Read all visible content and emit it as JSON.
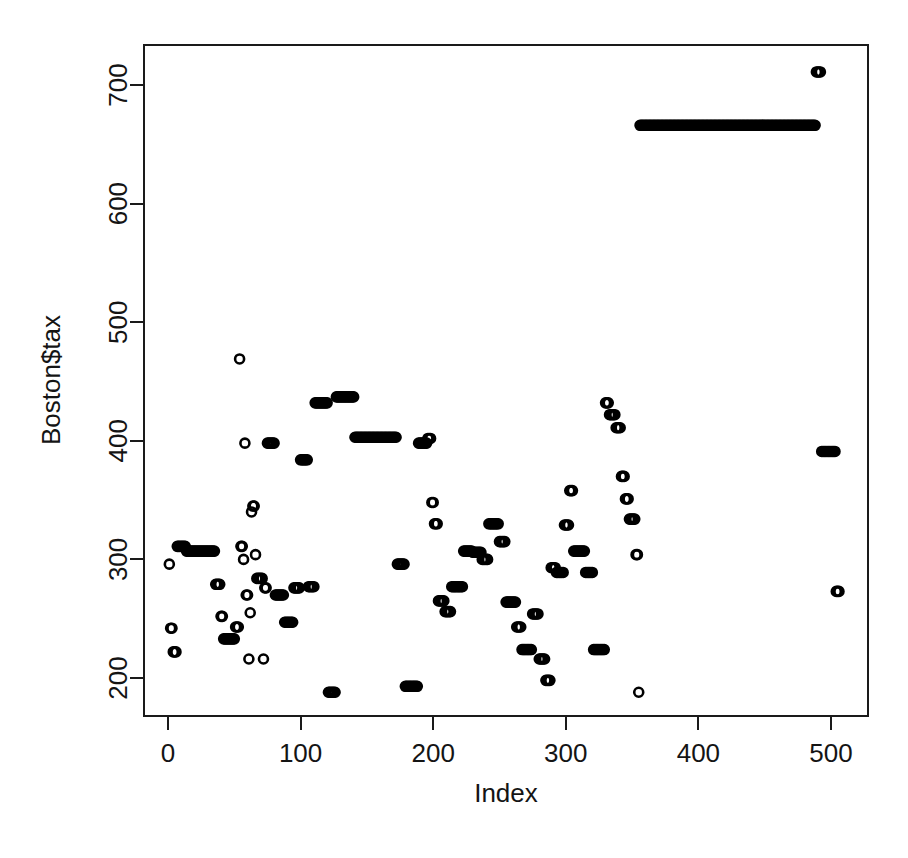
{
  "figure": {
    "background_color": "#ffffff",
    "foreground_color": "#000000",
    "width": 908,
    "height": 858
  },
  "axes": {
    "x_title": "Index",
    "y_title": "Boston$tax",
    "x_ticks": [
      "0",
      "100",
      "200",
      "300",
      "400",
      "500"
    ],
    "y_ticks": [
      "200",
      "300",
      "400",
      "500",
      "600",
      "700"
    ],
    "box": true,
    "grid": false
  },
  "chart_data": {
    "type": "scatter",
    "title": "",
    "xlabel": "Index",
    "ylabel": "Boston$tax",
    "xlim": [
      -9.1,
      515.1
    ],
    "ylim": [
      175.5,
      731.5
    ],
    "xticks": [
      0,
      100,
      200,
      300,
      400,
      500
    ],
    "yticks": [
      200,
      300,
      400,
      500,
      600,
      700
    ],
    "grid": false,
    "legend": null,
    "marker": {
      "shape": "open-circle",
      "color": "#000000",
      "size_px": 9,
      "stroke_width": 2.6
    },
    "n_points": 506,
    "series": [
      {
        "name": "Boston$tax",
        "x_start": 1,
        "x_step": 1,
        "values": [
          296,
          242,
          242,
          222,
          222,
          222,
          311,
          311,
          311,
          311,
          311,
          311,
          311,
          307,
          307,
          307,
          307,
          307,
          307,
          307,
          307,
          307,
          307,
          307,
          307,
          307,
          307,
          307,
          307,
          307,
          307,
          307,
          307,
          307,
          307,
          279,
          279,
          279,
          279,
          252,
          252,
          233,
          233,
          233,
          233,
          233,
          233,
          233,
          233,
          233,
          243,
          243,
          243,
          469,
          469,
          469,
          311,
          311,
          311,
          311,
          311,
          311,
          311,
          311,
          311,
          226,
          226,
          226,
          226,
          241,
          241,
          241,
          241,
          311,
          311,
          311,
          311,
          311,
          398,
          398,
          398,
          398,
          398,
          398,
          398,
          398,
          398,
          398,
          398,
          398,
          398,
          398,
          398,
          398,
          398,
          398,
          398,
          398,
          398,
          398,
          398,
          398,
          398,
          398,
          398,
          398,
          398,
          398,
          398,
          398,
          398,
          398,
          398,
          398,
          398,
          398,
          398,
          398,
          398,
          398,
          398,
          398,
          398,
          398,
          398,
          398,
          398,
          398,
          398,
          398,
          398,
          398,
          398,
          398,
          398,
          398,
          398,
          398,
          398,
          398,
          398,
          398,
          398,
          398,
          398,
          398,
          398,
          398,
          398,
          398,
          398,
          398,
          398,
          398,
          398,
          398,
          398,
          398,
          398,
          398,
          398,
          398,
          398,
          398,
          398,
          398,
          398,
          398,
          398,
          398,
          398,
          398,
          398,
          398,
          398,
          398,
          398,
          398,
          398,
          398,
          398,
          398,
          398,
          398,
          398,
          398,
          398,
          398,
          398,
          398,
          398,
          398,
          398,
          398,
          398,
          398,
          398,
          398,
          398,
          398,
          398,
          398,
          398,
          398,
          398,
          398,
          398,
          398,
          398,
          398,
          398,
          398,
          398,
          398,
          398,
          398,
          398,
          398,
          398,
          398,
          398,
          398,
          398,
          398,
          398,
          398,
          398,
          398,
          398,
          398,
          398,
          398,
          398,
          398,
          398,
          398,
          398,
          398,
          398,
          398,
          398,
          398,
          398,
          398,
          398,
          398,
          398,
          398,
          398,
          398,
          398,
          398,
          398,
          398,
          398,
          398,
          398,
          398,
          398,
          398,
          398,
          398,
          398,
          398,
          398,
          398,
          398,
          398,
          398,
          398,
          398,
          398,
          398,
          398,
          398,
          398,
          398,
          398,
          398,
          398,
          398,
          398,
          398,
          398,
          398,
          398,
          398,
          398,
          398,
          398,
          398,
          398,
          398,
          398,
          398,
          398,
          398,
          398,
          398,
          398,
          398,
          398,
          398,
          398,
          398,
          398,
          398,
          398,
          398,
          398,
          398,
          398,
          398,
          398,
          398,
          398,
          398,
          398,
          398,
          398,
          398,
          398,
          398,
          398,
          398,
          398,
          398,
          398,
          398,
          398,
          398,
          398,
          398,
          398,
          398,
          398,
          398,
          398,
          398,
          398,
          398,
          398,
          398,
          398,
          398,
          398,
          398,
          398,
          398,
          398,
          398,
          398,
          398,
          398,
          398,
          398,
          398,
          398,
          398,
          398,
          398,
          398,
          398,
          398,
          398,
          398,
          398,
          398,
          398,
          398,
          398,
          398,
          398,
          398,
          398,
          398,
          398,
          398,
          398,
          398,
          398,
          398,
          398,
          398,
          398,
          398,
          398,
          398,
          398,
          398,
          398,
          398,
          398,
          398,
          398,
          398,
          398,
          398,
          398,
          398,
          398,
          398,
          398,
          398,
          398,
          398,
          398,
          398,
          398,
          398,
          398,
          398,
          398,
          398,
          398,
          398,
          398,
          398,
          398,
          398,
          398,
          398,
          398,
          398,
          398,
          398,
          398,
          398,
          398,
          398,
          398,
          398,
          398,
          398,
          398,
          398,
          398,
          398,
          398,
          398,
          398,
          398,
          398,
          398,
          398,
          398,
          398,
          398,
          398,
          398,
          398,
          398,
          398,
          398,
          398,
          398,
          398,
          398,
          398,
          398,
          398,
          398,
          398,
          398,
          398,
          398,
          398,
          398,
          398,
          398,
          398,
          398,
          398,
          398,
          398,
          398,
          398,
          398,
          398,
          398,
          398,
          398,
          398,
          398,
          398,
          398,
          398,
          398,
          398,
          398,
          398,
          398,
          398,
          398,
          398,
          398,
          398,
          398,
          398,
          398,
          398,
          398,
          398,
          398,
          398,
          398
        ],
        "value_runs": [
          {
            "from": 1,
            "to": 1,
            "value": 296
          },
          {
            "from": 2,
            "to": 3,
            "value": 242
          },
          {
            "from": 4,
            "to": 6,
            "value": 222
          },
          {
            "from": 7,
            "to": 13,
            "value": 311
          },
          {
            "from": 14,
            "to": 35,
            "value": 307
          },
          {
            "from": 36,
            "to": 39,
            "value": 279
          },
          {
            "from": 40,
            "to": 41,
            "value": 252
          },
          {
            "from": 42,
            "to": 50,
            "value": 233
          },
          {
            "from": 51,
            "to": 53,
            "value": 243
          },
          {
            "from": 54,
            "to": 54,
            "value": 469
          },
          {
            "from": 55,
            "to": 56,
            "value": 311
          },
          {
            "from": 57,
            "to": 57,
            "value": 300
          },
          {
            "from": 58,
            "to": 58,
            "value": 398
          },
          {
            "from": 59,
            "to": 60,
            "value": 270
          },
          {
            "from": 61,
            "to": 61,
            "value": 216
          },
          {
            "from": 62,
            "to": 62,
            "value": 255
          },
          {
            "from": 63,
            "to": 63,
            "value": 340
          },
          {
            "from": 64,
            "to": 65,
            "value": 345
          },
          {
            "from": 66,
            "to": 66,
            "value": 304
          },
          {
            "from": 67,
            "to": 67,
            "value": 284
          },
          {
            "from": 68,
            "to": 71,
            "value": 284
          },
          {
            "from": 72,
            "to": 72,
            "value": 216
          },
          {
            "from": 73,
            "to": 74,
            "value": 276
          },
          {
            "from": 75,
            "to": 80,
            "value": 398
          },
          {
            "from": 81,
            "to": 87,
            "value": 270
          },
          {
            "from": 88,
            "to": 94,
            "value": 247
          },
          {
            "from": 95,
            "to": 99,
            "value": 276
          },
          {
            "from": 100,
            "to": 105,
            "value": 384
          },
          {
            "from": 106,
            "to": 110,
            "value": 277
          },
          {
            "from": 111,
            "to": 120,
            "value": 432
          },
          {
            "from": 121,
            "to": 126,
            "value": 188
          },
          {
            "from": 127,
            "to": 140,
            "value": 437
          },
          {
            "from": 141,
            "to": 172,
            "value": 403
          },
          {
            "from": 173,
            "to": 178,
            "value": 296
          },
          {
            "from": 179,
            "to": 188,
            "value": 193
          },
          {
            "from": 189,
            "to": 195,
            "value": 398
          },
          {
            "from": 196,
            "to": 198,
            "value": 402
          },
          {
            "from": 199,
            "to": 200,
            "value": 348
          },
          {
            "from": 201,
            "to": 203,
            "value": 330
          },
          {
            "from": 204,
            "to": 208,
            "value": 265
          },
          {
            "from": 209,
            "to": 213,
            "value": 256
          },
          {
            "from": 214,
            "to": 222,
            "value": 277
          },
          {
            "from": 223,
            "to": 229,
            "value": 307
          },
          {
            "from": 230,
            "to": 236,
            "value": 306
          },
          {
            "from": 237,
            "to": 241,
            "value": 300
          },
          {
            "from": 242,
            "to": 249,
            "value": 330
          },
          {
            "from": 250,
            "to": 254,
            "value": 315
          },
          {
            "from": 255,
            "to": 262,
            "value": 264
          },
          {
            "from": 263,
            "to": 266,
            "value": 243
          },
          {
            "from": 267,
            "to": 274,
            "value": 224
          },
          {
            "from": 275,
            "to": 279,
            "value": 254
          },
          {
            "from": 280,
            "to": 284,
            "value": 216
          },
          {
            "from": 285,
            "to": 288,
            "value": 198
          },
          {
            "from": 289,
            "to": 292,
            "value": 293
          },
          {
            "from": 293,
            "to": 298,
            "value": 289
          },
          {
            "from": 299,
            "to": 302,
            "value": 329
          },
          {
            "from": 303,
            "to": 305,
            "value": 358
          },
          {
            "from": 306,
            "to": 314,
            "value": 307
          },
          {
            "from": 315,
            "to": 320,
            "value": 289
          },
          {
            "from": 321,
            "to": 329,
            "value": 224
          },
          {
            "from": 330,
            "to": 332,
            "value": 432
          },
          {
            "from": 333,
            "to": 337,
            "value": 422
          },
          {
            "from": 338,
            "to": 341,
            "value": 411
          },
          {
            "from": 342,
            "to": 344,
            "value": 370
          },
          {
            "from": 345,
            "to": 347,
            "value": 351
          },
          {
            "from": 348,
            "to": 352,
            "value": 334
          },
          {
            "from": 353,
            "to": 354,
            "value": 304
          },
          {
            "from": 355,
            "to": 355,
            "value": 188
          },
          {
            "from": 356,
            "to": 488,
            "value": 666
          },
          {
            "from": 489,
            "to": 492,
            "value": 711
          },
          {
            "from": 493,
            "to": 503,
            "value": 391
          },
          {
            "from": 504,
            "to": 506,
            "value": 273
          }
        ]
      }
    ]
  },
  "layout": {
    "plot_box": {
      "left": 144,
      "top": 45,
      "right": 868,
      "bottom": 716
    },
    "x_pixel_for_0": 168,
    "x_pixel_for_500": 831,
    "y_pixel_for_200": 678,
    "y_pixel_for_700": 85
  }
}
